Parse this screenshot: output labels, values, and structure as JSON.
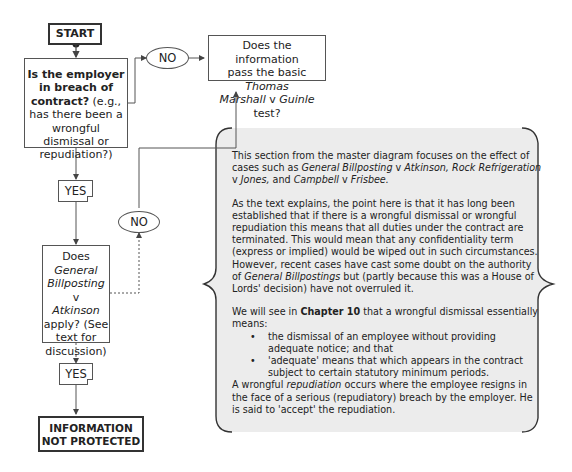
{
  "flowchart": {
    "start": "START",
    "q1": {
      "bold": "Is the employer in breach of contract?",
      "rest": " (e.g., has there been a wrongful dismissal or repudiation?)"
    },
    "no1": "NO",
    "q_marshall": {
      "line1": "Does the information",
      "line2a": "pass the basic ",
      "line2b": "Thomas",
      "line3a": "Marshall",
      "line3b": " v ",
      "line3c": "Guinle",
      "line3d": " test?"
    },
    "yes1": "YES",
    "q2": {
      "l1": "Does",
      "l2": "General",
      "l3a": "Billposting",
      "l3b": " v",
      "l4": "Atkinson",
      "l5": "apply? (See",
      "l6": "text for",
      "l7": "discussion)"
    },
    "no2": "NO",
    "yes2": "YES",
    "end": "INFORMATION NOT PROTECTED"
  },
  "note": {
    "p1": {
      "t1": "This section from the master diagram focuses on the effect of cases such as ",
      "c1": "General Billposting",
      "t2": " v ",
      "c2": "Atkinson, Rock Refrigeration",
      "t3": " v ",
      "c3": "Jones,",
      "t4": " and ",
      "c4": "Campbell",
      "t5": " v  ",
      "c5": "Frisbee."
    },
    "p2": {
      "t1": "As the text explains, the point here is that it has long been established that if there is a wrongful dismissal or wrongful repudiation this means that all duties under the contract are terminated. This would mean that any confidentiality term (express or implied) would be wiped out in such circumstances. However, recent cases have cast some doubt on the authority of ",
      "c1": "General Billpostings",
      "t2": " but (partly because this was a House of Lords' decision) have not overruled it."
    },
    "p3": {
      "t1": "We will see in ",
      "b1": "Chapter 10",
      "t2": " that a wrongful dismissal essentially means:",
      "bullets": [
        "the dismissal of an employee without providing adequate notice; and that",
        "'adequate' means that which appears in the contract subject to certain statutory minimum periods."
      ]
    },
    "p4": {
      "t1": "A wrongful ",
      "i1": "repudiation",
      "t2": " occurs where the employee resigns in the face of a serious (repudiatory) breach by the employer. He is said to 'accept' the repudiation."
    }
  },
  "colors": {
    "note_fill": "#ececec",
    "line": "#555555"
  }
}
